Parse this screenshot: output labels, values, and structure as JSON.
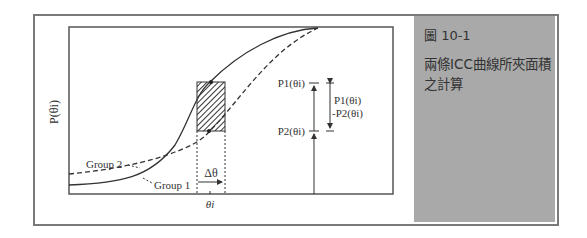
{
  "figure": {
    "number": "圖 10-1",
    "caption": "兩條ICC曲線所夾面積之計算"
  },
  "plot": {
    "ylabel": "P(θi)",
    "series": [
      {
        "name": "Group 1",
        "style": "solid"
      },
      {
        "name": "Group 2",
        "style": "dashed"
      }
    ],
    "labels": {
      "p1": "P1(θi)",
      "p2": "P2(θi)",
      "diff_top": "P1(θi)",
      "diff_bottom": "-P2(θi)",
      "delta": "Δθ",
      "theta": "θi",
      "group1": "Group 1",
      "group2": "Group 2"
    }
  },
  "colors": {
    "frame": "#7a7a7a",
    "side_panel": "#a9a9a9",
    "line": "#333333"
  }
}
